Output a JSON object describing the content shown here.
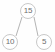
{
  "figure": {
    "name": "binary-tree-diagram",
    "width": 55,
    "height": 52,
    "background_color": "#fefefe",
    "node_fill_color": "#ffffff",
    "node_stroke_color": "#c9c9c9",
    "label_color": "#6e6e6e",
    "edge_color": "#b4b4b4"
  },
  "tree": {
    "root": {
      "id": "root",
      "label": "15",
      "cx": 28,
      "cy": 11,
      "r": 8
    },
    "children": [
      {
        "id": "left",
        "label": "10",
        "cx": 10,
        "cy": 42,
        "r": 8,
        "side": "left"
      },
      {
        "id": "right",
        "label": "5",
        "cx": 44,
        "cy": 42,
        "r": 8,
        "side": "right"
      }
    ],
    "edges": [
      {
        "from": "root",
        "to": "left",
        "x1": 22,
        "y1": 17,
        "x2": 16,
        "y2": 36
      },
      {
        "from": "root",
        "to": "right",
        "x1": 34,
        "y1": 17,
        "x2": 38,
        "y2": 36
      }
    ]
  }
}
